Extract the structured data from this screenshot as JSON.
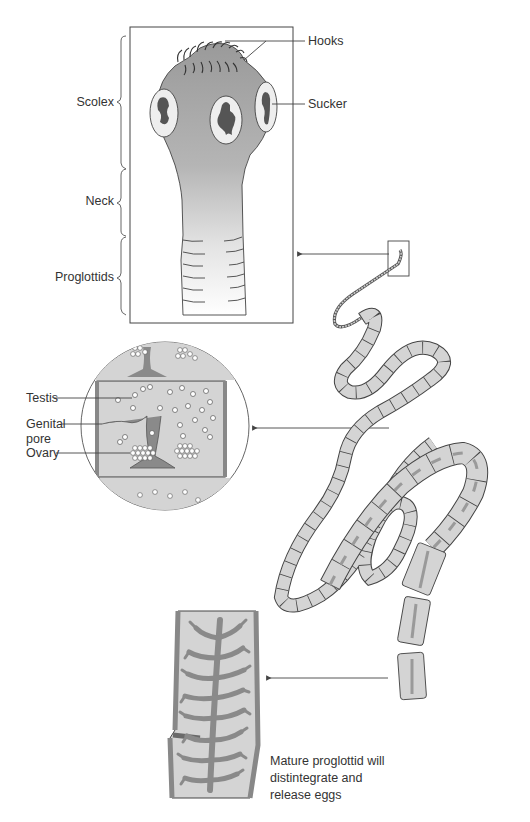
{
  "diagram": {
    "colors": {
      "body_gray": "#a8a8a8",
      "segment_fill": "#d4d4d4",
      "organ_dark": "#8a8a8a",
      "line": "#3a3a3a",
      "background": "#ffffff"
    },
    "scolex_panel": {
      "labels": {
        "hooks": "Hooks",
        "sucker": "Sucker",
        "scolex": "Scolex",
        "neck": "Neck",
        "proglottids": "Proglottids"
      }
    },
    "proglottid_detail": {
      "labels": {
        "testis": "Testis",
        "genital_pore": "Genital\npore",
        "ovary": "Ovary"
      }
    },
    "mature_proglottid": {
      "caption": "Mature proglottid will\ndistintegrate and\nrelease eggs"
    }
  }
}
